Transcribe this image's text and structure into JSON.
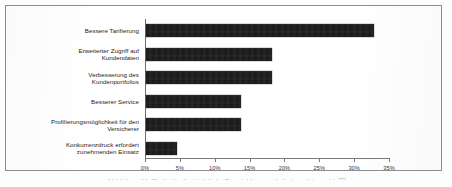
{
  "chart_data": {
    "type": "bar",
    "orientation": "horizontal",
    "title": "",
    "subtitle": "",
    "xlabel": "",
    "ylabel": "",
    "xlim": [
      0,
      35
    ],
    "grid": false,
    "legend": null,
    "legend_position": "none",
    "value_suffix": "%",
    "categories": [
      "Bessere Tarifierung",
      "Erweiterter Zugriff auf Kundendaten",
      "Verbesserung des Kundenportfolios",
      "Besserer Service",
      "Profilierungsmöglichkeit für den Versicherer",
      "Konkurrenzdruck erfordert zunehmenden Einsatz"
    ],
    "values": [
      32.7,
      18.1,
      18.1,
      13.6,
      13.6,
      4.5
    ],
    "tick_labels": [
      "0%",
      "5%",
      "10%",
      "15%",
      "20%",
      "25%",
      "30%",
      "35%"
    ],
    "tick_values": [
      0,
      5,
      10,
      15,
      20,
      25,
      30,
      35
    ],
    "bar_color": "#1c1c1c",
    "axis_color": "#7a7a7a",
    "frame_color": "#8d8d8d",
    "background_color": "#ffffff"
  },
  "labels": {
    "rows": [
      {
        "line1": "Bessere Tarifierung",
        "line2": ""
      },
      {
        "line1": "Erweiterter Zugriff auf",
        "line2": "Kundendaten"
      },
      {
        "line1": "Verbesserung des",
        "line2": "Kundenportfolios"
      },
      {
        "line1": "Besserer Service",
        "line2": ""
      },
      {
        "line1": "Profilierungsmöglichkeit für den",
        "line2": "Versicherer"
      },
      {
        "line1": "Konkurrenzdruck erfordert",
        "line2": "zunehmenden Einsatz"
      }
    ]
  },
  "caption": {
    "text": "Abbildung 21: Trails für Aufsichtliche Entwicklung nach Auftragshierarchie",
    "marker": "273"
  }
}
